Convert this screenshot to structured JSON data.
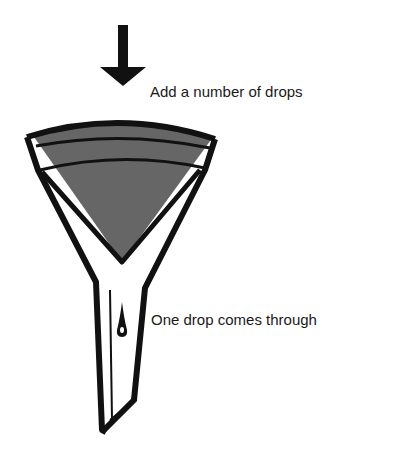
{
  "diagram": {
    "labels": {
      "top": "Add a number of drops",
      "bottom": "One drop comes through"
    },
    "colors": {
      "ink": "#111111",
      "liquid": "#666666",
      "background": "#ffffff"
    },
    "elements": [
      "down-arrow",
      "funnel",
      "liquid",
      "drop"
    ]
  }
}
